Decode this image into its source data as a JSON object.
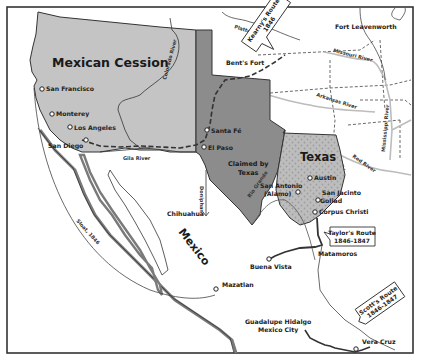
{
  "map": {
    "title": "Mexican-American War and the Mexican Cession",
    "colors": {
      "background": "#ffffff",
      "frame": "#333333",
      "mexican_cession": "#c4c4c4",
      "claimed_by_texas": "#8c8c8c",
      "texas": "#bdbdbd",
      "texas_dots": "#a3a3a3",
      "mexico_coast_shadow": "#7a7a7a",
      "route_line": "#333333",
      "river": "#bcbcbc",
      "boundary_dashed": "#444444"
    },
    "regions": {
      "mexican_cession": "Mexican Cession",
      "claimed_by_texas_line1": "Claimed by",
      "claimed_by_texas_line2": "Texas",
      "texas": "Texas",
      "mexico": "Mexico"
    },
    "cities": {
      "san_francisco": "San Francisco",
      "monterey": "Monterey",
      "los_angeles": "Los Angeles",
      "san_diego": "San Diego",
      "santa_fe": "Santa Fé",
      "el_paso": "El Paso",
      "chihuahua": "Chihuahua",
      "austin": "Austin",
      "san_antonio_line1": "San Antonio",
      "san_antonio_line2": "(Alamo)",
      "san_jacinto": "San Jacinto",
      "goliad": "Goliad",
      "corpus_christi": "Corpus Christi",
      "matamoros": "Matamoros",
      "buena_vista": "Buena Vista",
      "mazatlan": "Mazatlan",
      "guadalupe_hidalgo_line1": "Guadalupe Hidalgo",
      "guadalupe_hidalgo_line2": "Mexico City",
      "vera_cruz": "Vera Cruz",
      "bents_fort": "Bent's Fort",
      "fort_leavenworth": "Fort Leavenworth"
    },
    "rivers": {
      "colorado": "Colorado River",
      "gila": "Gila River",
      "platte": "Platte R.",
      "missouri": "Missouri River",
      "arkansas": "Arkansas River",
      "mississippi": "Mississippi River",
      "red": "Red River",
      "rio_grande": "Rio Grande"
    },
    "routes": {
      "kearny_line1": "Kearny's Route",
      "kearny_line2": "1846",
      "taylor_line1": "Taylor's Route",
      "taylor_line2": "1846-1847",
      "scott_line1": "Scott's Route",
      "scott_line2": "1846-1847",
      "sloat": "Sloat, 1846",
      "doniphan": "Doniphan"
    }
  }
}
